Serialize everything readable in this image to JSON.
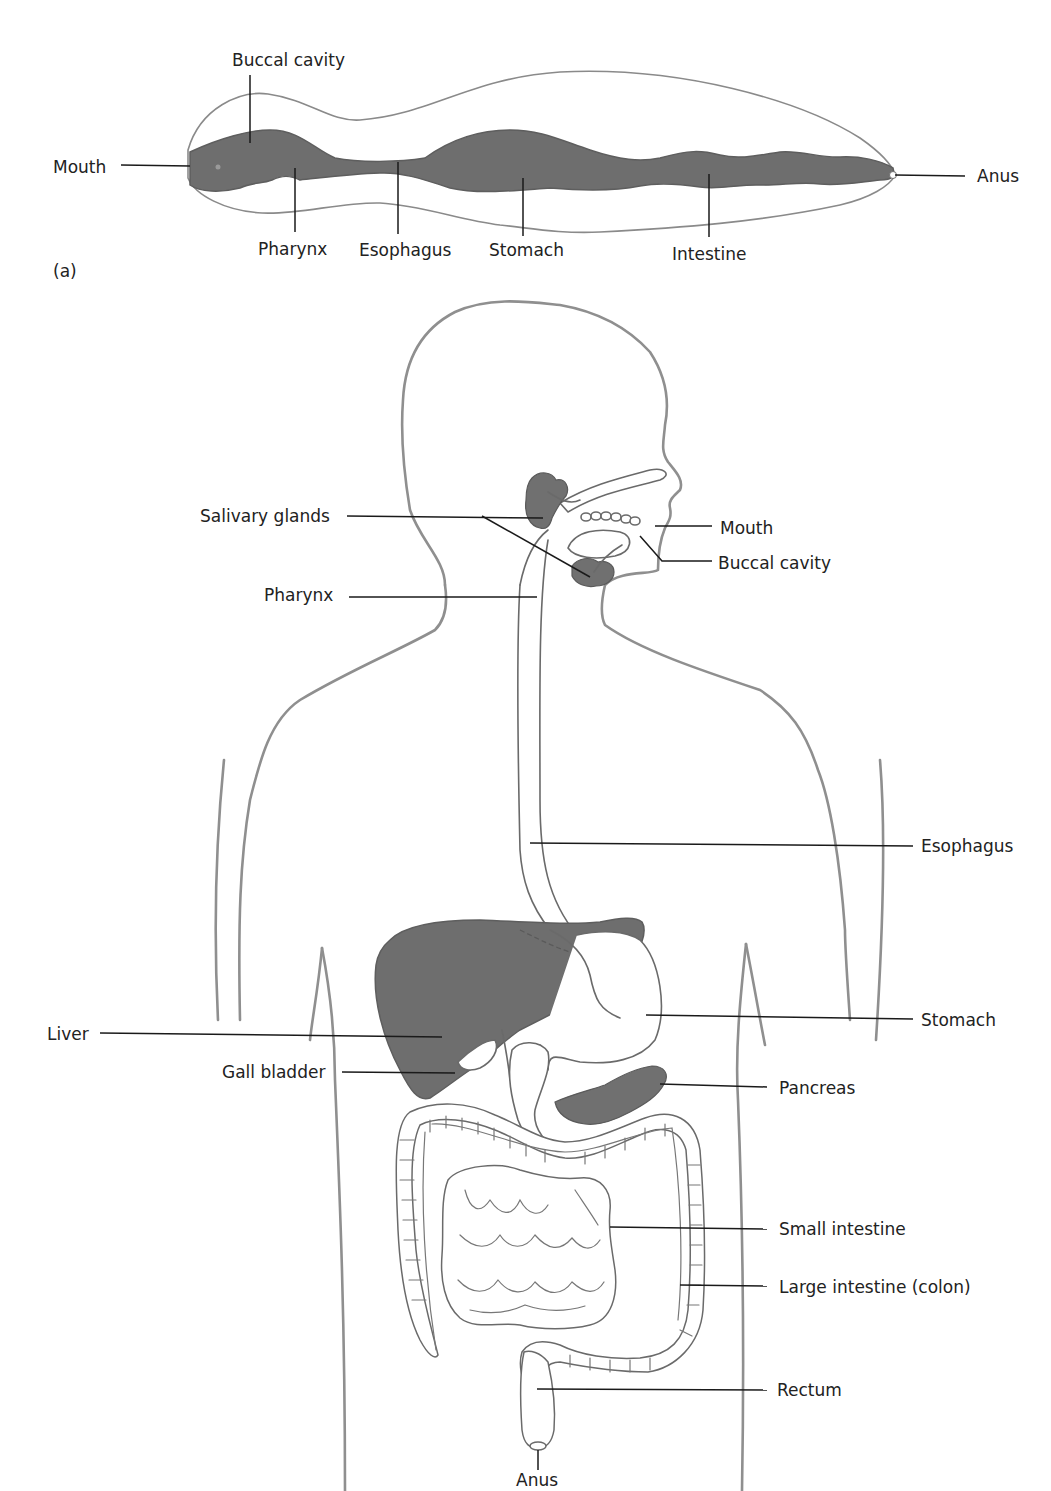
{
  "figure": {
    "panel_a_tag": "(a)",
    "panel_a": {
      "description": "Simple worm digestive tract (tube)",
      "labels": {
        "buccal_cavity": "Buccal cavity",
        "mouth": "Mouth",
        "pharynx": "Pharynx",
        "esophagus": "Esophagus",
        "stomach": "Stomach",
        "intestine": "Intestine",
        "anus": "Anus"
      }
    },
    "panel_b": {
      "description": "Human digestive system",
      "labels": {
        "salivary_glands": "Salivary glands",
        "mouth": "Mouth",
        "buccal_cavity": "Buccal cavity",
        "pharynx": "Pharynx",
        "esophagus": "Esophagus",
        "liver": "Liver",
        "stomach": "Stomach",
        "gall_bladder": "Gall bladder",
        "pancreas": "Pancreas",
        "small_intestine": "Small intestine",
        "large_intestine": "Large intestine (colon)",
        "rectum": "Rectum",
        "anus": "Anus"
      }
    },
    "colors": {
      "organ_fill": "#6e6e6e",
      "outline": "#8f8f8f",
      "leader": "#1a1a1a",
      "text": "#222222"
    }
  }
}
